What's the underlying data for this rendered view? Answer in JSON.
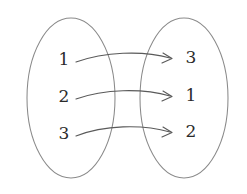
{
  "figure": {
    "background": "#ffffff",
    "outline_color": "#8a8a8a",
    "arrow_color": "#5a5a5a",
    "label_color": "#2b2b2b"
  },
  "domain_set": {
    "name": "domain",
    "ellipse": {
      "cx": 71,
      "cy": 98,
      "rx": 44,
      "ry": 80
    },
    "elements": [
      {
        "label": "1",
        "x": 64,
        "y": 60
      },
      {
        "label": "2",
        "x": 64,
        "y": 97
      },
      {
        "label": "3",
        "x": 64,
        "y": 134
      }
    ]
  },
  "codomain_set": {
    "name": "codomain",
    "ellipse": {
      "cx": 184,
      "cy": 98,
      "rx": 44,
      "ry": 80
    },
    "elements": [
      {
        "label": "3",
        "x": 191,
        "y": 58
      },
      {
        "label": "1",
        "x": 191,
        "y": 96
      },
      {
        "label": "2",
        "x": 191,
        "y": 132
      }
    ]
  },
  "mappings": [
    {
      "name": "map-1-to-3",
      "from": "1",
      "to": "3",
      "path": "M 76 62 C 104 52, 142 50, 170 58",
      "head": "M 163 53 L 172 58.5 L 162 63"
    },
    {
      "name": "map-2-to-1",
      "from": "2",
      "to": "1",
      "path": "M 76 99 C 104 89, 142 88, 170 96",
      "head": "M 163 91 L 172 96.5 L 162 101"
    },
    {
      "name": "map-3-to-2",
      "from": "3",
      "to": "2",
      "path": "M 76 136 C 104 125, 142 124, 170 132",
      "head": "M 163 127 L 172 132.5 L 162 137"
    }
  ]
}
